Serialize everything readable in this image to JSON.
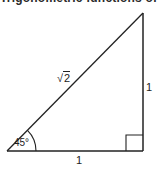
{
  "caption": {
    "text": "Trigonometric functions of 45°"
  },
  "triangle": {
    "type": "right-isosceles",
    "vertices": {
      "bottom_left": [
        7,
        151
      ],
      "bottom_right": [
        143,
        151
      ],
      "top_right": [
        143,
        13
      ]
    },
    "stroke_color": "#222222",
    "labels": {
      "hypotenuse": {
        "symbol": "√",
        "radicand": "2"
      },
      "vertical_side": "1",
      "horizontal_side": "1",
      "angle": "45°"
    },
    "right_angle_marker": true,
    "angle_arc": true
  }
}
